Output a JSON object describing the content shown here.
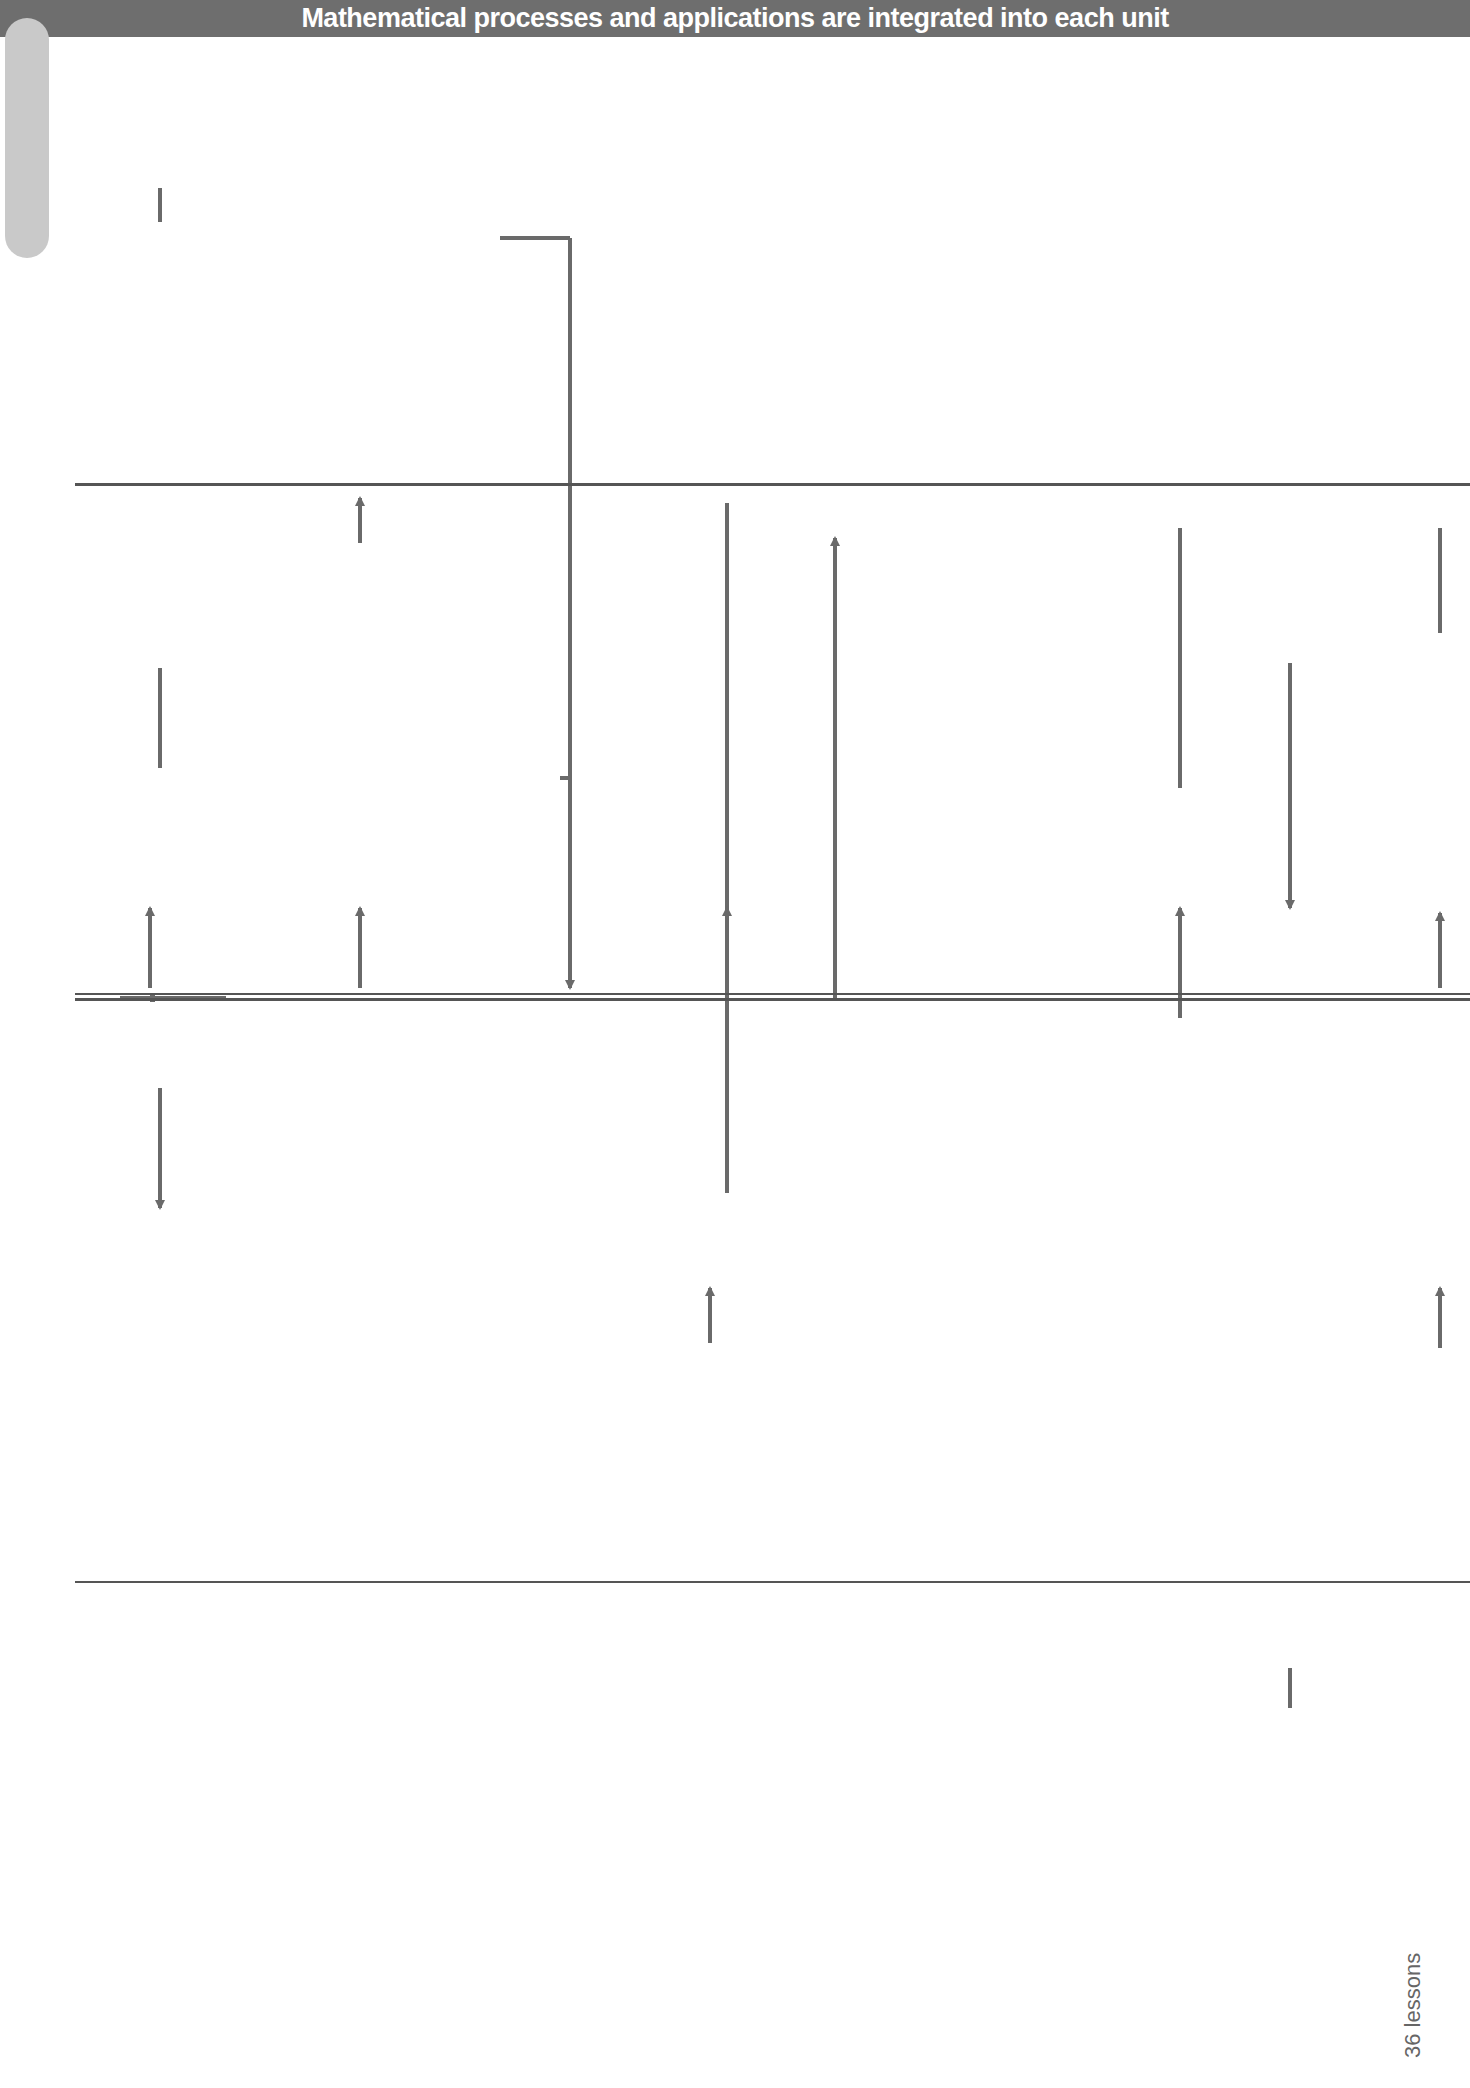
{
  "banner": {
    "text": "Mathematical processes and applications are integrated into each unit",
    "color": "#6e6e6e"
  },
  "terms": {
    "autumn": {
      "name": "",
      "lessons": "36 lessons"
    },
    "spring": {
      "name": "Spring",
      "lessons": "31 lessons"
    },
    "summer": {
      "name": "Summer",
      "lessons": "33 lessons"
    }
  },
  "total": {
    "label": "100 lessons",
    "color": "#707070"
  },
  "units": {
    "g41": {
      "title": "G4.1 Angles and shapes",
      "lines": [
        "Alternate and corresponding angles",
        "Angle, side, diagonal and symmetry",
        "properties of triangles, quadrilaterals and",
        "polygons",
        "Proof of angle sum/exterior angle of triangle",
        "Finding unknown angles"
      ],
      "lessons": "6 lessons"
    },
    "g42": {
      "title": "G4.2 Measures and mensuration",
      "lines": [
        "Using measures in problem solving",
        "Metric and imperial equivalents",
        "Perimeter and area of triangles, rectangles,",
        "parallelograms, trapeziums",
        "Volume and surface area of cuboids"
      ],
      "lessons": "5 lessons"
    },
    "g43": {
      "title": "G4.3 Transformations",
      "lines": [
        "Symmetries of 2D shapes",
        "Rotations, reflections and translations, on",
        "paper and using ICT",
        "Enlargement, given a centre of enlargement",
        "and a positive whole-number scale factor",
        "Coordinates of midpoint of line segment"
      ],
      "lessons": "6/7 lessons"
    },
    "g44": {
      "title": "G4.4 Constructions",
      "lines": [
        "Straight edge and compasses constructions",
        "of midpoints, perpendiculars, bisectors and",
        "triangles (SSS)",
        "Scale drawings; bearings",
        "Simple loci; exploring constructions with ICT"
      ],
      "lessons": "8/9 lessons"
    },
    "a41": {
      "title": "A4.1 Linear sequences",
      "lines": [
        "Integer sequences",
        "Linear sequences; general term;",
        "spreadsheet and calculator use"
      ],
      "lessons": "4 lessons"
    },
    "a42": {
      "title": "A4.2 Expressions and formulae",
      "lines": [
        "Simplifying linear expressions",
        "Deriving and substituting in",
        "simple formulae"
      ],
      "lessons": "4 lessons"
    },
    "a43": {
      "title": "A4.3 Functions and graphs",
      "lines": [
        "Mappings",
        "Graphs of linear functions",
        "Graphs of real situations"
      ],
      "lessons": "5/6 lessons"
    },
    "a44": {
      "title": "A4.4 Equations and formulae",
      "lines": [
        "Linear equations, unknowns both",
        "sides, brackets; using formulae"
      ],
      "lessons": "5/6 lessons"
    },
    "a45": {
      "title": "A4.5 Using algebra",
      "lines": [
        "Simplifying linear expressions",
        "Plotting graphs; graphs of real",
        "situations",
        "Using algebra to solve problems"
      ],
      "lessons": "7/8 lessons"
    },
    "r41": {
      "title": "R4.1 Revision/support",
      "lines": [
        "Number, algebra, geometry",
        "and measures, statistics"
      ],
      "lessons": "5 lessons"
    },
    "r42": {
      "title": "R4.2 Revision/support",
      "lines": [
        "Number, algebra, geometry",
        "and measures, statistics"
      ],
      "lessons": "5 lessons"
    },
    "n41": {
      "title": "N4.1 Properties of numbers",
      "lines": [
        "Add, subtract, multiply and divide integers",
        "Order of operations, including brackets",
        "Squares, cubes and roots; factors, primes,",
        "prime factor decomposition, HCF, LCM;",
        "calculator use"
      ],
      "lessons": "5 lessons"
    },
    "n42": {
      "title": "N4.2 Whole numbers, decimals and fractions",
      "lines": [
        "Decimal place value, ordering, rounding",
        "Mental and written calculations:",
        "adding/subtracting decimals; multiplying/dividing whole numbers",
        "Equivalent fractions; adding/subtracting fractions; fractions of",
        "quantities",
        "Calculator use, including fraction key"
      ],
      "lessons": "6 lessons"
    },
    "n43": {
      "title": "N4.3 Fractions, decimals and percentages",
      "lines": [
        "Equivalent fractions; ordering fractions",
        "Multiplying/dividing decimals by decimals;",
        "adding/subtracting fractions; fractions of quantities; multiplying/",
        "dividing by proper fraction",
        "Percentage increases and decreases",
        "Calculator use"
      ],
      "lessons": "5/6 lessons"
    },
    "n44": {
      "title": "N4.4 Proportional reasoning",
      "lines": [
        "Calculating ratios; simple scale drawings",
        "Direct proportion; unitary method",
        "Using fractions, decimals and",
        "percentages to compare proportions"
      ],
      "lessons": "5/6 lessons"
    },
    "n45": {
      "title": "N4.5 Solving problems",
      "lines": [
        "Number problems and investigations",
        "Using algebra to solve problems",
        "History of mathematics"
      ],
      "lessons": "2/3 lessons"
    },
    "s41": {
      "title": "S4.1 Probability",
      "lines": [
        "Mutually exclusive outcomes for",
        "single events and two successive",
        "events",
        "Estimating probabilities from",
        "experimental data"
      ],
      "lessons": "6 lessons"
    },
    "s42": {
      "title": "S4.2 Enquiry 1",
      "lines": [
        "Collecting, representing,",
        "interpreting data: two-way tables,",
        "bar charts for grouped discrete",
        "data, scatter graphs, pie charts,",
        "stem-and-leaf diagrams",
        "Comparing distributions using",
        "mean, median, mode or modal",
        "class"
      ],
      "lessons": "5/6 lessons"
    },
    "s43": {
      "title": "S4.3 Enquiry 2",
      "lines": [
        "Collecting, representing,",
        "interpreting data: frequency tables",
        "and diagrams for continuous data,",
        "line graphs",
        "Calculating statistics",
        "Comparing distributions using",
        "mean, median, mode or modal class"
      ],
      "lessons": "6/7 lessons"
    }
  },
  "footer": {
    "book": "Exploring maths",
    "tier": "Tier 4",
    "section": "Introduction",
    "page": "i"
  },
  "colors": {
    "box": "#c9c9c9",
    "box_light": "#dcdcdc",
    "connector": "#6a6a6a"
  }
}
